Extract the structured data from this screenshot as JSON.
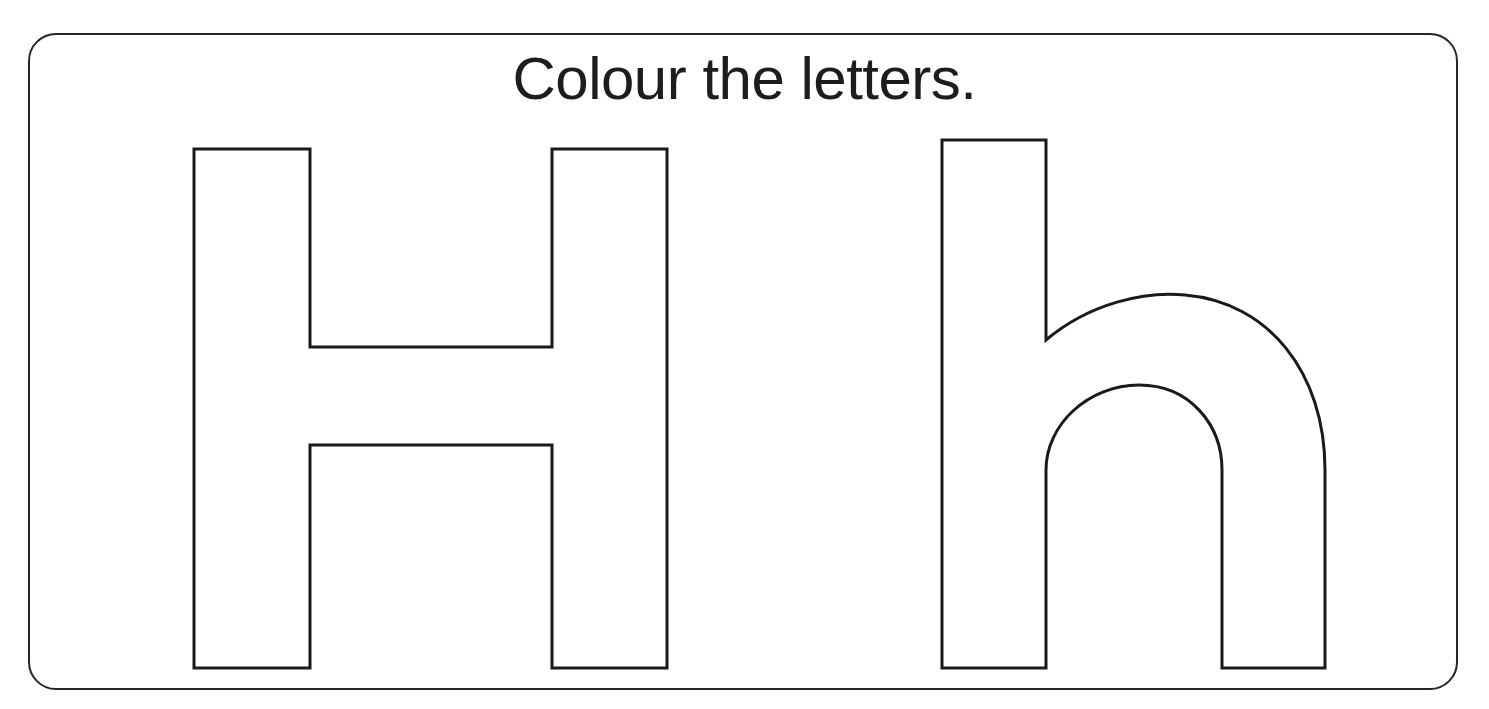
{
  "page": {
    "type": "worksheet",
    "background_color": "#ffffff",
    "width": 1489,
    "height": 709
  },
  "frame": {
    "name": "rounded-border",
    "stroke_color": "#262626",
    "stroke_width": 2.5,
    "corner_radius": 28,
    "left": 28,
    "top": 33,
    "width": 1430,
    "height": 657
  },
  "instruction": {
    "text": "Colour the letters.",
    "color": "#1d1d1d",
    "font_size": 60,
    "align": "center"
  },
  "letters": [
    {
      "character": "H",
      "case": "uppercase",
      "label": "uppercase-letter-H",
      "outline_color": "#1a1a1a",
      "fill_color": "#ffffff",
      "stroke_width": 3,
      "bounds": {
        "left": 194,
        "top": 149,
        "right": 667,
        "bottom": 668
      },
      "path": "M 194 149 L 310 149 L 310 347 L 552 347 L 552 149 L 667 149 L 667 668 L 552 668 L 552 445 L 310 445 L 310 668 L 194 668 Z"
    },
    {
      "character": "h",
      "case": "lowercase",
      "label": "lowercase-letter-h",
      "outline_color": "#1a1a1a",
      "fill_color": "#ffffff",
      "stroke_width": 3,
      "bounds": {
        "left": 942,
        "top": 140,
        "right": 1325,
        "bottom": 668
      },
      "path": "M 942 140 L 1046 140 L 1046 340 C 1090 303 1145 291 1185 295 C 1268 302 1325 372 1325 470 L 1325 668 L 1222 668 L 1222 470 C 1222 425 1190 385 1139 385 C 1089 385 1046 424 1046 470 L 1046 668 L 942 668 Z"
    }
  ],
  "colors": {
    "ink": "#1a1a1a",
    "frame": "#262626",
    "paper": "#ffffff"
  }
}
